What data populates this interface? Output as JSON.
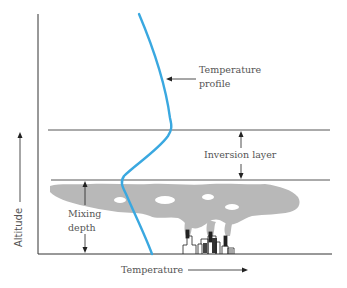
{
  "diagram": {
    "labels": {
      "temperature_profile_line1": "Temperature",
      "temperature_profile_line2": "profile",
      "inversion_layer": "Inversion layer",
      "mixing_depth_line1": "Mixing",
      "mixing_depth_line2": "depth",
      "x_axis": "Temperature",
      "y_axis": "Altitude"
    },
    "colors": {
      "profile_line": "#3aa8e0",
      "axes": "#333333",
      "layer_lines": "#444444",
      "smog": "#b5b5b5",
      "text": "#555555"
    },
    "elements": {
      "x_axis": "Temperature (increasing to the right)",
      "y_axis": "Altitude (increasing upward)",
      "inversion_top_line": "upper boundary of inversion layer",
      "inversion_bottom_line": "lower boundary of inversion layer / top of mixing layer",
      "smog_cloud": "pollution trapped below inversion",
      "city": "factories with smokestacks emitting smoke"
    }
  }
}
